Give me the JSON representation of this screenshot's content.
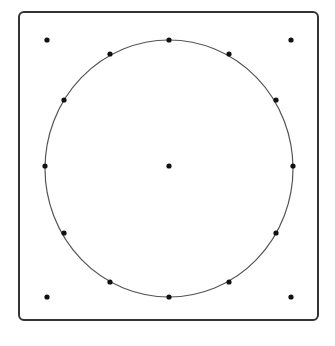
{
  "diagram": {
    "frame": {
      "x": 18,
      "y": 11,
      "width": 301,
      "height": 310,
      "radius": 6,
      "stroke": "#333333"
    },
    "circle": {
      "cx": 169,
      "cy": 168.5,
      "rx": 124,
      "ry": 128.5,
      "stroke": "#555555"
    },
    "point_color": "#111111",
    "point_radius": 2.6,
    "center_point": {
      "x": 169,
      "y": 166
    },
    "circle_points": [
      {
        "x": 169,
        "y": 40
      },
      {
        "x": 229,
        "y": 54
      },
      {
        "x": 276,
        "y": 100
      },
      {
        "x": 293,
        "y": 166
      },
      {
        "x": 276,
        "y": 233
      },
      {
        "x": 229,
        "y": 282
      },
      {
        "x": 169,
        "y": 297
      },
      {
        "x": 110,
        "y": 282
      },
      {
        "x": 64,
        "y": 233
      },
      {
        "x": 45,
        "y": 166
      },
      {
        "x": 64,
        "y": 100
      },
      {
        "x": 110,
        "y": 54
      }
    ],
    "corner_points": [
      {
        "x": 47,
        "y": 40
      },
      {
        "x": 291,
        "y": 40
      },
      {
        "x": 47,
        "y": 297
      },
      {
        "x": 291,
        "y": 297
      }
    ]
  }
}
